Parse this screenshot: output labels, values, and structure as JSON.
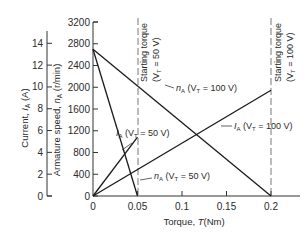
{
  "chart_data": {
    "type": "line",
    "title": "",
    "xlabel": "Torque, T(Nm)",
    "ylabel_left_outer": "Current, I_A (A)",
    "ylabel_left_inner": "Armature speed, n_A (r/min)",
    "xlim": [
      0,
      0.2
    ],
    "ylim_speed": [
      0,
      3200
    ],
    "ylim_current": [
      0,
      14
    ],
    "x_ticks": [
      "0",
      "0.05",
      "0.1",
      "0.15",
      "0.2"
    ],
    "speed_ticks": [
      "0",
      "400",
      "800",
      "1200",
      "1600",
      "2000",
      "2400",
      "2800",
      "3200"
    ],
    "current_ticks": [
      "0",
      "2",
      "4",
      "6",
      "8",
      "10",
      "12",
      "14"
    ],
    "grid": false,
    "series": [
      {
        "name": "n_A (V_T = 100 V)",
        "axis": "speed",
        "x": [
          0,
          0.2
        ],
        "values": [
          2700,
          0
        ]
      },
      {
        "name": "n_A (V_T = 50 V)",
        "axis": "speed",
        "x": [
          0,
          0.05
        ],
        "values": [
          2700,
          0
        ]
      },
      {
        "name": "I_A (V_T = 100 V)",
        "axis": "current",
        "x": [
          0,
          0.2
        ],
        "values": [
          0,
          9.7
        ]
      },
      {
        "name": "I_A (V_T = 50 V)",
        "axis": "current",
        "x": [
          0,
          0.05
        ],
        "values": [
          0,
          5.4
        ]
      }
    ],
    "annotations": [
      {
        "text": "Starting torque (V_T = 50 V)",
        "x": 0.05,
        "style": "dashed vertical"
      },
      {
        "text": "Starting torque (V_T = 100 V)",
        "x": 0.2,
        "style": "dashed vertical"
      }
    ]
  },
  "labels": {
    "x_axis_title": "Torque, ",
    "x_axis_var": "T",
    "x_axis_unit": "(Nm)",
    "current_title_a": "Current, ",
    "current_title_b": "I",
    "current_title_sub": "A",
    "current_title_c": " (A)",
    "speed_title_a": "Armature speed, ",
    "speed_title_b": "n",
    "speed_title_sub": "A",
    "speed_title_c": " (r/min)",
    "start50_line1": "Starting torque",
    "start50_line2": "(V",
    "start50_sub": "T",
    "start50_line2b": " = 50 V)",
    "start100_line1": "Starting torque",
    "start100_line2": "(V",
    "start100_sub": "T",
    "start100_line2b": " = 100 V)",
    "nA100_a": "n",
    "nA100_sub": "A",
    "nA100_b": " (V",
    "nA100_sub2": "T",
    "nA100_c": " = 100 V)",
    "nA50_a": "n",
    "nA50_sub": "A",
    "nA50_b": " (V",
    "nA50_sub2": "T",
    "nA50_c": " = 50 V)",
    "IA100_a": "I",
    "IA100_sub": "A",
    "IA100_b": " (V",
    "IA100_sub2": "T",
    "IA100_c": " = 100 V)",
    "IA50_a": "I",
    "IA50_sub": "A",
    "IA50_b": " (V",
    "IA50_sub2": "T",
    "IA50_c": " = 50 V)"
  },
  "colors": {
    "line": "#1a1a1a",
    "axis": "#333333",
    "text": "#2a2a2a"
  }
}
